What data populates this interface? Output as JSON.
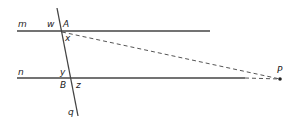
{
  "diagram": {
    "lines": {
      "m": {
        "label": "m"
      },
      "n": {
        "label": "n"
      },
      "q": {
        "label": "q"
      }
    },
    "points": {
      "A": {
        "label": "A"
      },
      "B": {
        "label": "B"
      },
      "P": {
        "label": "P"
      }
    },
    "angles": {
      "w": {
        "label": "w"
      },
      "x": {
        "label": "x"
      },
      "y": {
        "label": "y"
      },
      "z": {
        "label": "z"
      }
    },
    "colors": {
      "line": "#444444",
      "dashed": "#555555",
      "text": "#222222"
    }
  }
}
